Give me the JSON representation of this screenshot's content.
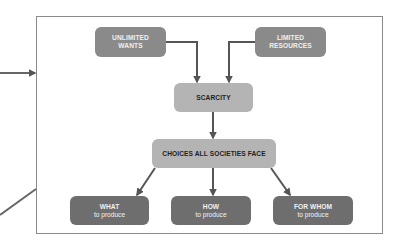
{
  "diagram": {
    "type": "flowchart",
    "nodes": {
      "unlimited_wants": {
        "line1": "UNLIMITED",
        "line2": "WANTS"
      },
      "limited_resources": {
        "line1": "LIMITED",
        "line2": "RESOURCES"
      },
      "scarcity": {
        "label": "SCARCITY"
      },
      "choices": {
        "label": "CHOICES ALL SOCIETIES FACE"
      },
      "what": {
        "title": "WHAT",
        "subtitle": "to produce"
      },
      "how": {
        "title": "HOW",
        "subtitle": "to produce"
      },
      "for_whom": {
        "title": "FOR WHOM",
        "subtitle": "to produce"
      }
    },
    "edges": [
      {
        "from": "unlimited_wants",
        "to": "scarcity"
      },
      {
        "from": "limited_resources",
        "to": "scarcity"
      },
      {
        "from": "scarcity",
        "to": "choices"
      },
      {
        "from": "choices",
        "to": "what"
      },
      {
        "from": "choices",
        "to": "how"
      },
      {
        "from": "choices",
        "to": "for_whom"
      }
    ],
    "colors": {
      "dark_node": "#6e6e6e",
      "mid_node": "#8a8a8a",
      "light_node": "#b4b4b4",
      "arrow": "#555555",
      "frame": "#8a8a8a"
    }
  }
}
